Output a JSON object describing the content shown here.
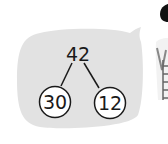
{
  "diagram": {
    "type": "number-bond",
    "whole": "42",
    "parts": [
      "30",
      "12"
    ]
  },
  "colors": {
    "bubble": "#e2e2e2",
    "stroke": "#1a1a1a",
    "circle_fill": "#ffffff"
  }
}
